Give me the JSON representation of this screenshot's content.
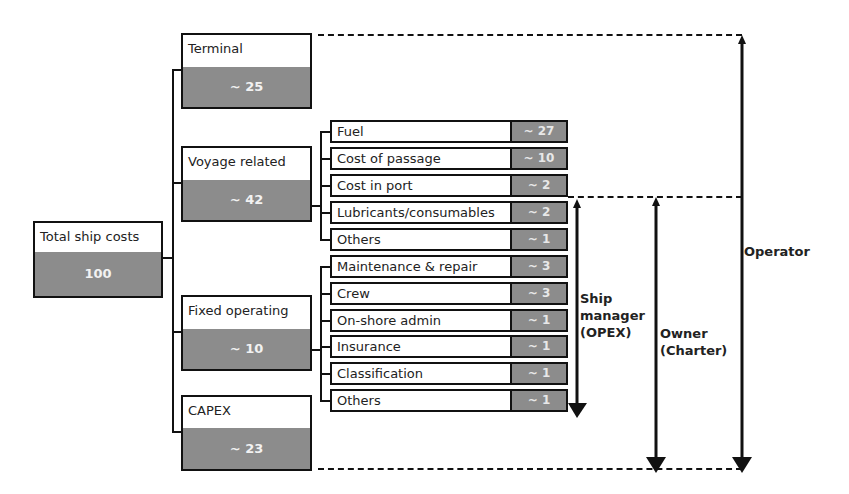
{
  "root": {
    "label": "Total ship costs",
    "value": "100"
  },
  "categories": [
    {
      "label": "Terminal",
      "value": "~ 25"
    },
    {
      "label": "Voyage related",
      "value": "~ 42"
    },
    {
      "label": "Fixed operating",
      "value": "~ 10"
    },
    {
      "label": "CAPEX",
      "value": "~ 23"
    }
  ],
  "voyage_items": [
    {
      "label": "Fuel",
      "value": "~ 27"
    },
    {
      "label": "Cost of passage",
      "value": "~ 10"
    },
    {
      "label": "Cost in port",
      "value": "~ 2"
    },
    {
      "label": "Lubricants/consumables",
      "value": "~ 2"
    },
    {
      "label": "Others",
      "value": "~ 1"
    }
  ],
  "fixed_items": [
    {
      "label": "Maintenance & repair",
      "value": "~ 3"
    },
    {
      "label": "Crew",
      "value": "~ 3"
    },
    {
      "label": "On-shore admin",
      "value": "~ 1"
    },
    {
      "label": "Insurance",
      "value": "~ 1"
    },
    {
      "label": "Classification",
      "value": "~ 1"
    },
    {
      "label": "Others",
      "value": "~ 1"
    }
  ],
  "responsibility": {
    "ship_manager": {
      "line1": "Ship",
      "line2": "manager",
      "line3": "(OPEX)"
    },
    "owner": {
      "line1": "Owner",
      "line2": "(Charter)"
    },
    "operator": {
      "line1": "Operator"
    }
  },
  "colors": {
    "box_fill": "#8c8c8c",
    "line": "#111111"
  }
}
